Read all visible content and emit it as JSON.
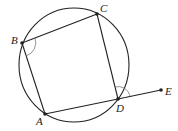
{
  "diagram": {
    "type": "cyclic-quadrilateral",
    "circle": {
      "cx": 74,
      "cy": 65,
      "rx": 55,
      "ry": 57
    },
    "points": [
      {
        "name": "A",
        "x": 45,
        "y": 114,
        "label_x": 36,
        "label_y": 125
      },
      {
        "name": "B",
        "x": 22,
        "y": 43,
        "label_x": 11,
        "label_y": 44
      },
      {
        "name": "C",
        "x": 97,
        "y": 14,
        "label_x": 100,
        "label_y": 12
      },
      {
        "name": "D",
        "x": 118,
        "y": 99,
        "label_x": 116,
        "label_y": 112
      },
      {
        "name": "E",
        "x": 161,
        "y": 90,
        "label_x": 165,
        "label_y": 95
      }
    ],
    "segments": [
      "AB",
      "BC",
      "CD",
      "DA",
      "DE"
    ],
    "angle_marks": [
      "ABC",
      "CDE"
    ],
    "colors": {
      "stroke": "#222222",
      "background": "#ffffff"
    }
  }
}
